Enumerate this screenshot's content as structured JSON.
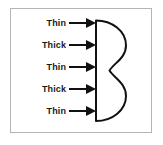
{
  "figure": {
    "title": "Thin and thick region labels pointing to a double-lobed cross-section",
    "border_color": "#b4b4b4",
    "background_color": "#ffffff",
    "ink_color": "#111111"
  },
  "rows": [
    {
      "label": "Thin",
      "arrow": "arrow-right-icon"
    },
    {
      "label": "Thick",
      "arrow": "arrow-right-icon"
    },
    {
      "label": "Thin",
      "arrow": "arrow-right-icon"
    },
    {
      "label": "Thick",
      "arrow": "arrow-right-icon"
    },
    {
      "label": "Thin",
      "arrow": "arrow-right-icon"
    }
  ],
  "shape": {
    "name": "double-lobe-cross-section",
    "description": "Vertical straight left edge with two rounded lobes bulging to the right, narrowing at the middle waist",
    "stroke_color": "#111111",
    "stroke_width": 2,
    "fill": "none"
  }
}
